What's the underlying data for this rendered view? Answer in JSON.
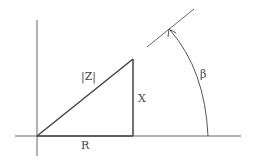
{
  "diagram": {
    "labels": {
      "hypotenuse": "|Z|",
      "vertical_side": "X",
      "horizontal_side": "R",
      "angle": "β"
    },
    "colors": {
      "line": "#555555",
      "text": "#444444",
      "background": "#ffffff"
    }
  }
}
